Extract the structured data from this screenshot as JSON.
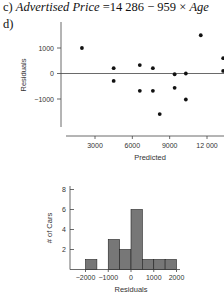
{
  "part_c": {
    "label": "c)",
    "lhs": "Advertised Price",
    "rhs": " =14 286 − 959 × ",
    "var": "Age"
  },
  "part_d": {
    "label": "d)"
  },
  "chart_data": [
    {
      "type": "scatter",
      "title": "",
      "xlabel": "Predicted",
      "ylabel": "Residuals",
      "xticks": [
        "3000",
        "6000",
        "9000",
        "12 000"
      ],
      "xtick_values": [
        3000,
        6000,
        9000,
        12000
      ],
      "yticks": [
        "1000",
        "0",
        "−1000"
      ],
      "ytick_values": [
        1000,
        0,
        -1000
      ],
      "xlim": [
        400,
        13400
      ],
      "ylim": [
        -2000,
        1900
      ],
      "reference_line_y": 0,
      "grid": false,
      "points": [
        {
          "x": 1950,
          "y": 1000
        },
        {
          "x": 4500,
          "y": 210
        },
        {
          "x": 4500,
          "y": -290
        },
        {
          "x": 6600,
          "y": 330
        },
        {
          "x": 6600,
          "y": -680
        },
        {
          "x": 7650,
          "y": 210
        },
        {
          "x": 7650,
          "y": -680
        },
        {
          "x": 8200,
          "y": -1590
        },
        {
          "x": 9400,
          "y": -30
        },
        {
          "x": 9400,
          "y": -560
        },
        {
          "x": 10300,
          "y": 0
        },
        {
          "x": 10300,
          "y": -1020
        },
        {
          "x": 11500,
          "y": 1500
        },
        {
          "x": 13300,
          "y": 600
        },
        {
          "x": 13300,
          "y": 100
        }
      ]
    },
    {
      "type": "bar",
      "subtype": "histogram",
      "title": "",
      "xlabel": "Residuals",
      "ylabel": "# of Cars",
      "xticks": [
        "−2000",
        "−1000",
        "0",
        "1000",
        "2000"
      ],
      "xtick_values": [
        -2000,
        -1000,
        0,
        1000,
        2000
      ],
      "yticks": [
        "2",
        "4",
        "6",
        "8"
      ],
      "ytick_values": [
        2,
        4,
        6,
        8
      ],
      "ylim": [
        0,
        8
      ],
      "bin_width": 500,
      "bins": [
        {
          "from": -2000,
          "to": -1500,
          "count": 1
        },
        {
          "from": -1500,
          "to": -1000,
          "count": 0
        },
        {
          "from": -1000,
          "to": -500,
          "count": 3
        },
        {
          "from": -500,
          "to": 0,
          "count": 2
        },
        {
          "from": 0,
          "to": 500,
          "count": 6
        },
        {
          "from": 500,
          "to": 1000,
          "count": 1
        },
        {
          "from": 1000,
          "to": 1500,
          "count": 1
        },
        {
          "from": 1500,
          "to": 2000,
          "count": 1
        }
      ],
      "bar_color": "#777777"
    }
  ]
}
